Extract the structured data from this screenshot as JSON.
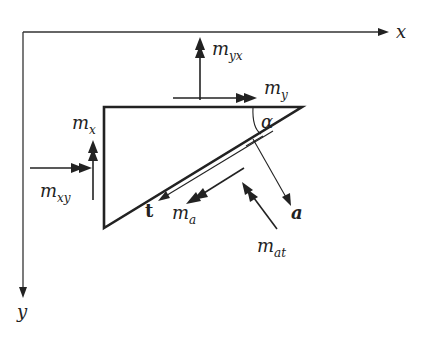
{
  "figure": {
    "type": "free-body diagram of triangular plate element with moments",
    "axes": {
      "x_label": "x",
      "y_label": "y"
    },
    "angle_label": "α",
    "vectors": {
      "normal": "a",
      "tangent": "t"
    },
    "moments": {
      "m_x": {
        "base": "m",
        "sub": "x"
      },
      "m_xy": {
        "base": "m",
        "sub": "xy"
      },
      "m_y": {
        "base": "m",
        "sub": "y"
      },
      "m_yx": {
        "base": "m",
        "sub": "yx"
      },
      "m_a": {
        "base": "m",
        "sub": "a"
      },
      "m_at": {
        "base": "m",
        "sub": "at"
      }
    },
    "colors": {
      "ink": "#222222",
      "background": "#ffffff"
    }
  }
}
